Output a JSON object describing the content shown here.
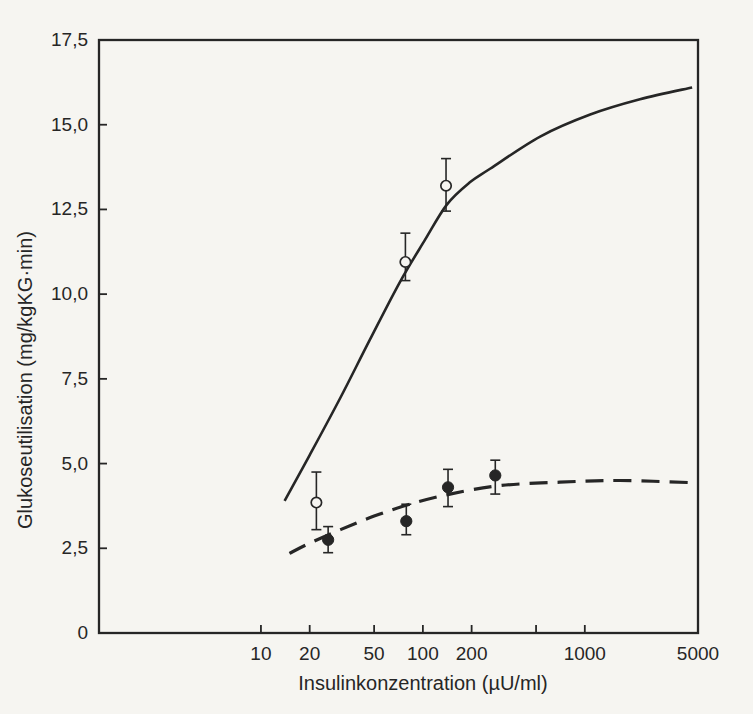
{
  "figure": {
    "background": "#f6f5f1",
    "ink": "#262626"
  },
  "chart_data": {
    "type": "line",
    "title": "",
    "xlabel": "Insulinkonzentration (µU/ml)",
    "ylabel": "Glukoseutilisation (mg/kgKG·min)",
    "x_scale": "log",
    "xlim": [
      1,
      5000
    ],
    "ylim": [
      0,
      17.5
    ],
    "grid": false,
    "legend": null,
    "x_ticks": [
      {
        "value": 10,
        "label": "10"
      },
      {
        "value": 20,
        "label": "20"
      },
      {
        "value": 50,
        "label": "50"
      },
      {
        "value": 100,
        "label": "100"
      },
      {
        "value": 200,
        "label": "200"
      },
      {
        "value": 500,
        "label": ""
      },
      {
        "value": 1000,
        "label": "1000"
      },
      {
        "value": 5000,
        "label": "5000"
      }
    ],
    "y_ticks": [
      {
        "value": 0,
        "label": "0"
      },
      {
        "value": 2.5,
        "label": "2,5"
      },
      {
        "value": 5,
        "label": "5,0"
      },
      {
        "value": 7.5,
        "label": "7,5"
      },
      {
        "value": 10,
        "label": "10,0"
      },
      {
        "value": 12.5,
        "label": "12,5"
      },
      {
        "value": 15,
        "label": "15,0"
      },
      {
        "value": 17.5,
        "label": "17,5"
      }
    ],
    "series": [
      {
        "name": "open-circles-solid-curve",
        "line_style": "solid",
        "marker": "open-circle",
        "curve": [
          [
            14,
            3.9
          ],
          [
            20,
            5.25
          ],
          [
            31,
            6.95
          ],
          [
            47,
            8.65
          ],
          [
            72,
            10.35
          ],
          [
            103,
            11.6
          ],
          [
            141,
            12.65
          ],
          [
            195,
            13.3
          ],
          [
            260,
            13.7
          ],
          [
            530,
            14.65
          ],
          [
            1080,
            15.3
          ],
          [
            2190,
            15.75
          ],
          [
            4600,
            16.1
          ]
        ],
        "points": [
          {
            "x": 22,
            "y": 3.85,
            "err_lo": 3.05,
            "err_hi": 4.75
          },
          {
            "x": 78,
            "y": 10.95,
            "err_lo": 10.4,
            "err_hi": 11.8
          },
          {
            "x": 139,
            "y": 13.2,
            "err_lo": 12.45,
            "err_hi": 14.0
          }
        ]
      },
      {
        "name": "filled-circles-dashed-curve",
        "line_style": "dashed",
        "marker": "filled-circle",
        "curve": [
          [
            15,
            2.35
          ],
          [
            20,
            2.65
          ],
          [
            31,
            3.05
          ],
          [
            50,
            3.45
          ],
          [
            83,
            3.8
          ],
          [
            147,
            4.1
          ],
          [
            300,
            4.35
          ],
          [
            700,
            4.45
          ],
          [
            1650,
            4.5
          ],
          [
            5000,
            4.43
          ]
        ],
        "points": [
          {
            "x": 26,
            "y": 2.75,
            "err_lo": 2.37,
            "err_hi": 3.14
          },
          {
            "x": 79,
            "y": 3.3,
            "err_lo": 2.9,
            "err_hi": 3.8
          },
          {
            "x": 143,
            "y": 4.3,
            "err_lo": 3.73,
            "err_hi": 4.83
          },
          {
            "x": 280,
            "y": 4.65,
            "err_lo": 4.1,
            "err_hi": 5.1
          }
        ]
      }
    ]
  }
}
